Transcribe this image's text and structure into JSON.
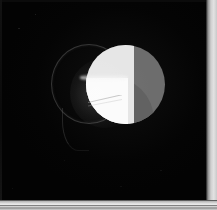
{
  "image": {
    "title": "Astronomical eclipse exposure",
    "background_color": "#030303",
    "border_strip_color": "#e2e2e2",
    "alt_text": "Dark photographic plate showing a gray disc overlapped on its left limb by a bright white crescent, with a faint outer halo circle to the left"
  },
  "canvas": {
    "width": 217,
    "height": 210
  },
  "objects": {
    "disc": {
      "name": "gray-disc",
      "color": "#6d6d6d",
      "shade_color": "#626262",
      "center_x": 125,
      "center_y": 84,
      "radius": 39
    },
    "crescent": {
      "name": "bright-crescent",
      "pale_color": "#e6e6e6",
      "bright_color": "#fbfbfb",
      "center_x": 125,
      "center_y": 84,
      "radius": 39
    },
    "halo": {
      "name": "faint-halo-outline",
      "color": "#787878",
      "center_x": 88,
      "center_y": 83,
      "radius_x": 37,
      "radius_y": 39
    },
    "streak": {
      "name": "diagonal-streak",
      "color": "#969696"
    }
  },
  "edges": {
    "right_strip_label": "film margin right",
    "bottom_strip_label": "film margin bottom",
    "right_strip_x": 206,
    "bottom_strip_y": 200
  }
}
